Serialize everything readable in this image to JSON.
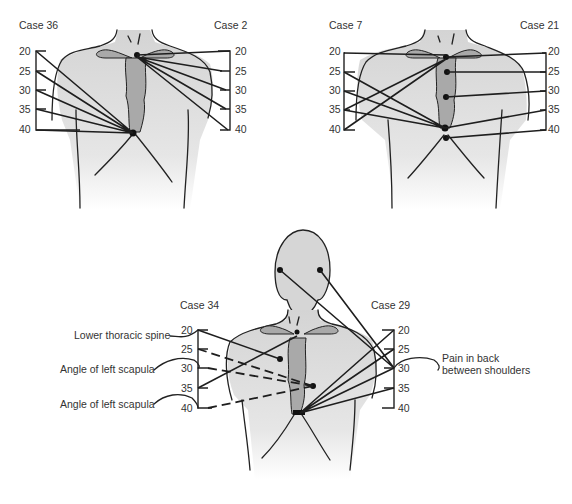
{
  "figure": {
    "panels": [
      {
        "id": "top-left",
        "left_case": "Case 36",
        "right_case": "Case 2",
        "scale_ticks": [
          "20",
          "25",
          "30",
          "35",
          "40"
        ]
      },
      {
        "id": "top-right",
        "left_case": "Case 7",
        "right_case": "Case 21",
        "scale_ticks": [
          "20",
          "25",
          "30",
          "35",
          "40"
        ]
      },
      {
        "id": "bottom",
        "left_case": "Case 34",
        "right_case": "Case 29",
        "scale_ticks": [
          "20",
          "25",
          "30",
          "35",
          "40"
        ],
        "annotations": {
          "lower_thoracic_spine": "Lower thoracic spine",
          "angle_left_scapula_1": "Angle of left scapula",
          "angle_left_scapula_2": "Angle of left scapula",
          "pain_back_line1": "Pain in back",
          "pain_back_line2": "between shoulders"
        }
      }
    ],
    "colors": {
      "body_fill": "#d9d9d9",
      "sternum_fill": "#a9a9a9",
      "line": "#1e1e1e",
      "text": "#333333"
    }
  }
}
